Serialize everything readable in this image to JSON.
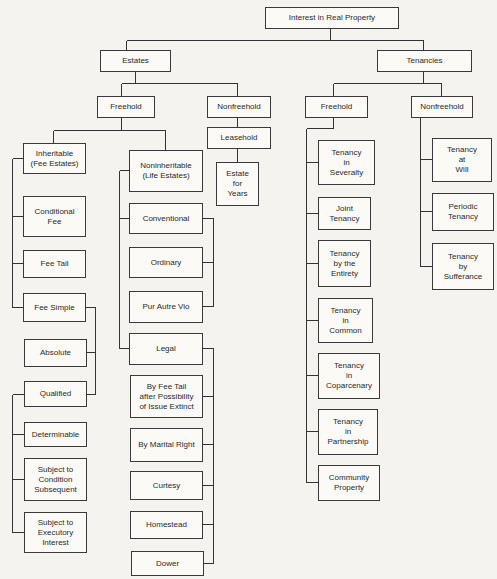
{
  "diagram": {
    "type": "hierarchy-tree",
    "root": "Interest in Real Property",
    "nodes": [
      {
        "id": "root",
        "label": "Interest in Real Property",
        "box": [
          265,
          7,
          133,
          21
        ]
      },
      {
        "id": "estates",
        "label": "Estates",
        "box": [
          100,
          50,
          70,
          21
        ]
      },
      {
        "id": "tenancies",
        "label": "Tenancies",
        "box": [
          377,
          50,
          94,
          21
        ]
      },
      {
        "id": "estates-freehold",
        "label": "Freehold",
        "box": [
          97,
          96,
          57,
          21
        ]
      },
      {
        "id": "estates-nonfreehold",
        "label": "Nonfreehold",
        "box": [
          207,
          96,
          63,
          21
        ]
      },
      {
        "id": "leasehold",
        "label": "Leasehold",
        "box": [
          207,
          127,
          63,
          21
        ]
      },
      {
        "id": "estate-for-years",
        "label": "Estate\nfor\nYears",
        "box": [
          216,
          162,
          43,
          43
        ]
      },
      {
        "id": "inheritable",
        "label": "Inheritable\n(Fee Estates)",
        "box": [
          23,
          143,
          62,
          30
        ]
      },
      {
        "id": "noninheritable",
        "label": "Noninheritable\n(Life Estates)",
        "box": [
          129,
          150,
          73,
          41
        ]
      },
      {
        "id": "conditional-fee",
        "label": "Conditional\nFee",
        "box": [
          23,
          196,
          62,
          40
        ]
      },
      {
        "id": "fee-tail",
        "label": "Fee Tail",
        "box": [
          23,
          250,
          62,
          27
        ]
      },
      {
        "id": "fee-simple",
        "label": "Fee Simple",
        "box": [
          23,
          293,
          62,
          28
        ]
      },
      {
        "id": "absolute",
        "label": "Absolute",
        "box": [
          24,
          339,
          62,
          27
        ]
      },
      {
        "id": "qualified",
        "label": "Qualified",
        "box": [
          24,
          381,
          62,
          25
        ]
      },
      {
        "id": "determinable",
        "label": "Determinable",
        "box": [
          24,
          422,
          62,
          24
        ]
      },
      {
        "id": "subject-to-condition-subsequent",
        "label": "Subject to\nCondition\nSubsequent",
        "box": [
          24,
          458,
          62,
          42
        ]
      },
      {
        "id": "subject-to-executory-interest",
        "label": "Subject to\nExecutory\nInterest",
        "box": [
          24,
          512,
          62,
          40
        ]
      },
      {
        "id": "conventional",
        "label": "Conventional",
        "box": [
          129,
          203,
          73,
          30
        ]
      },
      {
        "id": "ordinary",
        "label": "Ordinary",
        "box": [
          129,
          247,
          73,
          30
        ]
      },
      {
        "id": "pur-autre-vio",
        "label": "Pur Autre Vio",
        "box": [
          129,
          291,
          73,
          31
        ]
      },
      {
        "id": "legal",
        "label": "Legal",
        "box": [
          129,
          333,
          73,
          31
        ]
      },
      {
        "id": "by-fee-tail",
        "label": "By Fee Tail\nafter Possibility\nof Issue Extinct",
        "box": [
          130,
          375,
          72,
          42
        ]
      },
      {
        "id": "by-marital-right",
        "label": "By Marital Right",
        "box": [
          130,
          428,
          72,
          33
        ]
      },
      {
        "id": "curtesy",
        "label": "Curtesy",
        "box": [
          130,
          471,
          72,
          28
        ]
      },
      {
        "id": "homestead",
        "label": "Homestead",
        "box": [
          130,
          511,
          72,
          27
        ]
      },
      {
        "id": "dower",
        "label": "Dower",
        "box": [
          131,
          551,
          72,
          24
        ]
      },
      {
        "id": "tenancies-freehold",
        "label": "Freehold",
        "box": [
          305,
          96,
          62,
          21
        ]
      },
      {
        "id": "tenancies-nonfreehold",
        "label": "Nonfreehold",
        "box": [
          411,
          96,
          61,
          21
        ]
      },
      {
        "id": "tenancy-in-severalty",
        "label": "Tenancy\nin\nSeveralty",
        "box": [
          318,
          140,
          56,
          44
        ]
      },
      {
        "id": "joint-tenancy",
        "label": "Joint\nTenancy",
        "box": [
          318,
          197,
          52,
          32
        ]
      },
      {
        "id": "tenancy-by-the-entirety",
        "label": "Tenancy\nby the\nEntirety",
        "box": [
          318,
          240,
          52,
          46
        ]
      },
      {
        "id": "tenancy-in-common",
        "label": "Tenancy\nin\nCommon",
        "box": [
          318,
          298,
          54,
          44
        ]
      },
      {
        "id": "tenancy-in-coparcenary",
        "label": "Tenancy\nin\nCoparcenary",
        "box": [
          318,
          353,
          61,
          45
        ]
      },
      {
        "id": "tenancy-in-partnership",
        "label": "Tenancy\nin\nPartnership",
        "box": [
          318,
          409,
          59,
          45
        ]
      },
      {
        "id": "community-property",
        "label": "Community\nProperty",
        "box": [
          318,
          465,
          61,
          35
        ]
      },
      {
        "id": "tenancy-at-will",
        "label": "Tenancy\nat\nWill",
        "box": [
          432,
          138,
          59,
          43
        ]
      },
      {
        "id": "periodic-tenancy",
        "label": "Periodic\nTenancy",
        "box": [
          432,
          193,
          61,
          37
        ]
      },
      {
        "id": "tenancy-by-sufferance",
        "label": "Tenancy\nby\nSufferance",
        "box": [
          432,
          243,
          61,
          46
        ]
      }
    ],
    "edges": [
      [
        "root",
        "estates"
      ],
      [
        "root",
        "tenancies"
      ],
      [
        "estates",
        "estates-freehold"
      ],
      [
        "estates",
        "estates-nonfreehold"
      ],
      [
        "estates-nonfreehold",
        "leasehold"
      ],
      [
        "leasehold",
        "estate-for-years"
      ],
      [
        "estates-freehold",
        "inheritable"
      ],
      [
        "estates-freehold",
        "noninheritable"
      ],
      [
        "inheritable",
        "conditional-fee"
      ],
      [
        "inheritable",
        "fee-tail"
      ],
      [
        "inheritable",
        "fee-simple"
      ],
      [
        "fee-simple",
        "absolute"
      ],
      [
        "fee-simple",
        "qualified"
      ],
      [
        "qualified",
        "determinable"
      ],
      [
        "qualified",
        "subject-to-condition-subsequent"
      ],
      [
        "qualified",
        "subject-to-executory-interest"
      ],
      [
        "noninheritable",
        "conventional"
      ],
      [
        "noninheritable",
        "legal"
      ],
      [
        "conventional",
        "ordinary"
      ],
      [
        "conventional",
        "pur-autre-vio"
      ],
      [
        "legal",
        "by-fee-tail"
      ],
      [
        "legal",
        "by-marital-right"
      ],
      [
        "by-marital-right",
        "curtesy"
      ],
      [
        "by-marital-right",
        "homestead"
      ],
      [
        "by-marital-right",
        "dower"
      ],
      [
        "tenancies",
        "tenancies-freehold"
      ],
      [
        "tenancies",
        "tenancies-nonfreehold"
      ],
      [
        "tenancies-freehold",
        "tenancy-in-severalty"
      ],
      [
        "tenancies-freehold",
        "joint-tenancy"
      ],
      [
        "tenancies-freehold",
        "tenancy-by-the-entirety"
      ],
      [
        "tenancies-freehold",
        "tenancy-in-common"
      ],
      [
        "tenancies-freehold",
        "tenancy-in-coparcenary"
      ],
      [
        "tenancies-freehold",
        "tenancy-in-partnership"
      ],
      [
        "tenancies-freehold",
        "community-property"
      ],
      [
        "tenancies-nonfreehold",
        "tenancy-at-will"
      ],
      [
        "tenancies-nonfreehold",
        "periodic-tenancy"
      ],
      [
        "tenancies-nonfreehold",
        "tenancy-by-sufferance"
      ]
    ]
  },
  "labels": {
    "root": "Interest in Real Property",
    "estates": "Estates",
    "tenancies": "Tenancies",
    "estates_freehold": "Freehold",
    "estates_nonfreehold": "Nonfreehold",
    "leasehold": "Leasehold",
    "estate_for_years": "Estate\nfor\nYears",
    "inheritable": "Inheritable\n(Fee Estates)",
    "noninheritable": "Noninheritable\n(Life Estates)",
    "conditional_fee": "Conditional\nFee",
    "fee_tail": "Fee Tail",
    "fee_simple": "Fee Simple",
    "absolute": "Absolute",
    "qualified": "Qualified",
    "determinable": "Determinable",
    "subject_condition": "Subject to\nCondition\nSubsequent",
    "subject_executory": "Subject to\nExecutory\nInterest",
    "conventional": "Conventional",
    "ordinary": "Ordinary",
    "pur_autre_vio": "Pur Autre Vio",
    "legal": "Legal",
    "by_fee_tail": "By Fee Tail\nafter Possibility\nof Issue Extinct",
    "by_marital_right": "By Marital Right",
    "curtesy": "Curtesy",
    "homestead": "Homestead",
    "dower": "Dower",
    "tenancies_freehold": "Freehold",
    "tenancies_nonfreehold": "Nonfreehold",
    "tenancy_severalty": "Tenancy\nin\nSeveralty",
    "joint_tenancy": "Joint\nTenancy",
    "tenancy_entirety": "Tenancy\nby the\nEntirety",
    "tenancy_common": "Tenancy\nin\nCommon",
    "tenancy_coparcenary": "Tenancy\nin\nCoparcenary",
    "tenancy_partnership": "Tenancy\nin\nPartnership",
    "community_property": "Community\nProperty",
    "tenancy_at_will": "Tenancy\nat\nWill",
    "periodic_tenancy": "Periodic\nTenancy",
    "tenancy_sufferance": "Tenancy\nby\nSufferance"
  },
  "colors": {
    "background": "#f4f3f0",
    "box_fill": "#fbfaf7",
    "line": "#333333",
    "text": "#2a2a2a"
  }
}
